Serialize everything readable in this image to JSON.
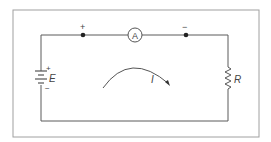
{
  "diagram": {
    "type": "series-circuit",
    "colors": {
      "frame": "#9a9a9a",
      "wire": "#555555",
      "node": "#222222",
      "text": "#444444",
      "background": "#ffffff"
    },
    "components": {
      "battery": {
        "symbol": "E",
        "positive_label": "+",
        "negative_label": "−"
      },
      "ammeter": {
        "symbol": "A"
      },
      "resistor": {
        "symbol": "R"
      },
      "current": {
        "symbol": "I",
        "direction": "clockwise"
      }
    },
    "terminals": {
      "left": {
        "polarity": "+"
      },
      "right": {
        "polarity": "−"
      }
    }
  }
}
